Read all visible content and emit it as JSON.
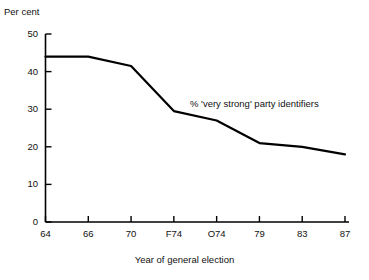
{
  "chart_data": {
    "type": "line",
    "title": "",
    "xlabel": "Year of general election",
    "ylabel": "Per cent",
    "categories": [
      "64",
      "66",
      "70",
      "F74",
      "O74",
      "79",
      "83",
      "87"
    ],
    "values": [
      44,
      44,
      41.5,
      29.5,
      27,
      21,
      20,
      18
    ],
    "series": [
      {
        "name": "% 'very strong' party identifiers",
        "values": [
          44,
          44,
          41.5,
          29.5,
          27,
          21,
          20,
          18
        ]
      }
    ],
    "annotations": [
      {
        "text": "% 'very strong' party identifiers"
      }
    ],
    "ylim": [
      0,
      50
    ],
    "yticks": [
      0,
      10,
      20,
      30,
      40,
      50
    ],
    "ytick_labels": [
      "0",
      "10",
      "20",
      "30",
      "40",
      "50"
    ],
    "xtick_labels": [
      "64",
      "66",
      "70",
      "F74",
      "O74",
      "79",
      "83",
      "87"
    ],
    "grid": false,
    "legend": "none",
    "line_color": "#000000"
  },
  "axes": {
    "y_title": "Per cent",
    "x_title": "Year of general election"
  },
  "annotation": {
    "series_label": "% 'very strong' party identifiers"
  }
}
